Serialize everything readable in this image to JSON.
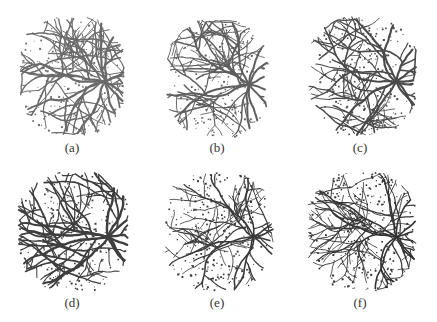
{
  "figure": {
    "panels": [
      {
        "label": "(a)",
        "x": 2,
        "y": 0,
        "img": {
          "x": 18,
          "y": 17,
          "w": 104,
          "h": 118
        },
        "seed": 11,
        "thickness": 2.2,
        "noise": 160,
        "color": "#6a6a6a",
        "caption_y": 140
      },
      {
        "label": "(b)",
        "x": 147,
        "y": 0,
        "img": {
          "x": 20,
          "y": 20,
          "w": 100,
          "h": 117
        },
        "seed": 23,
        "thickness": 2.0,
        "noise": 190,
        "color": "#5e5e5e",
        "caption_y": 140
      },
      {
        "label": "(c)",
        "x": 290,
        "y": 0,
        "img": {
          "x": 18,
          "y": 17,
          "w": 108,
          "h": 118
        },
        "seed": 37,
        "thickness": 2.1,
        "noise": 240,
        "color": "#4a4a4a",
        "caption_y": 140
      },
      {
        "label": "(d)",
        "x": 2,
        "y": 162,
        "img": {
          "x": 16,
          "y": 10,
          "w": 110,
          "h": 118
        },
        "seed": 41,
        "thickness": 2.4,
        "noise": 220,
        "color": "#3e3e3e",
        "caption_y": 133
      },
      {
        "label": "(e)",
        "x": 147,
        "y": 162,
        "img": {
          "x": 18,
          "y": 10,
          "w": 108,
          "h": 118
        },
        "seed": 53,
        "thickness": 1.6,
        "noise": 260,
        "color": "#3a3a3a",
        "caption_y": 133
      },
      {
        "label": "(f)",
        "x": 290,
        "y": 162,
        "img": {
          "x": 18,
          "y": 10,
          "w": 108,
          "h": 118
        },
        "seed": 67,
        "thickness": 1.6,
        "noise": 270,
        "color": "#333333",
        "caption_y": 133
      }
    ]
  }
}
